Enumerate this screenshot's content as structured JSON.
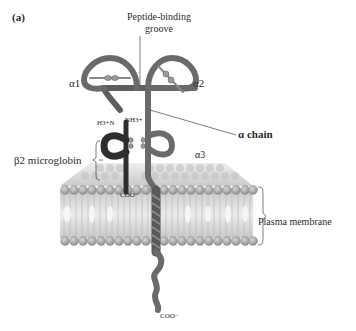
{
  "figure": {
    "panel_label": "(a)",
    "labels": {
      "peptide_binding_groove_line1": "Peptide-binding",
      "peptide_binding_groove_line2": "groove",
      "alpha1": "α1",
      "alpha2": "α2",
      "alpha3": "α3",
      "alpha_chain": "α chain",
      "h3n": "H3+N",
      "nh3": "NH3+",
      "beta2_microglobin": "β2 microglobin",
      "coo_beta2": "COO−",
      "plasma_membrane": "Plasma membrane",
      "coo_tail": "COO−"
    },
    "annotations": {
      "disulfide": "S-S"
    },
    "colors": {
      "alpha_chain": "#7a7a7a",
      "beta2_microglobin": "#2e2e2e",
      "lipid_head": "#a8a8a8",
      "lipid_tail": "#d8d8d8"
    }
  }
}
